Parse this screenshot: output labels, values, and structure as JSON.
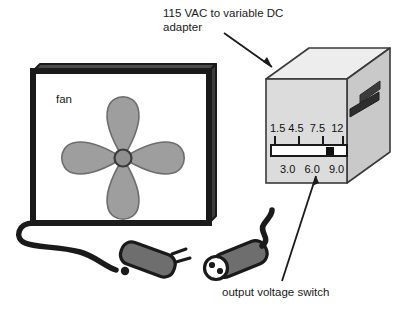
{
  "diagram": {
    "title_annotation": "115 VAC to variable DC\nadapter",
    "fan_label": "fan",
    "switch_annotation": "output voltage switch",
    "voltage_scale": {
      "top_row": "1.5 4.5  7.5  12",
      "bottom_row": "3.0   6.0   9.0",
      "top_values": [
        "1.5",
        "4.5",
        "7.5",
        "12"
      ],
      "bottom_values": [
        "3.0",
        "6.0",
        "9.0"
      ],
      "selected_value": "9.0",
      "tick_count": 4
    },
    "components": {
      "fan_blade_count": 4,
      "connector_male_name": "male-barrel-plug",
      "connector_female_name": "female-barrel-socket",
      "female_hole_count": 2,
      "vent_slot_count": 2
    },
    "colors": {
      "outline": "#1a1a1a",
      "blade_fill": "#9e9e9e",
      "box_front": "#dcdcdc",
      "box_top": "#ededed",
      "box_side": "#c9c9c9",
      "connector_body": "#6e6e6e",
      "scale_bar": "#ffffff",
      "marker": "#111111",
      "background": "#ffffff"
    }
  }
}
